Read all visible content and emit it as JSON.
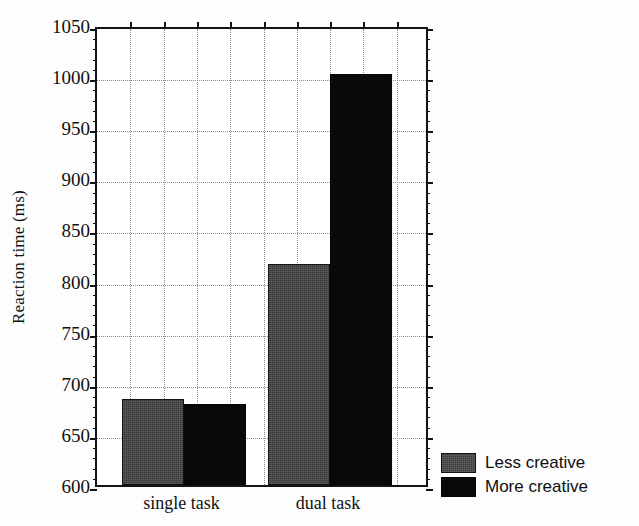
{
  "chart_data": {
    "type": "bar",
    "title": "",
    "xlabel": "",
    "ylabel": "Reaction time (ms)",
    "categories": [
      "single task",
      "dual task"
    ],
    "series": [
      {
        "name": "Less creative",
        "color": "#3a3a3a",
        "values": [
          684,
          816
        ]
      },
      {
        "name": "More creative",
        "color": "#090909",
        "values": [
          679,
          1002
        ]
      }
    ],
    "ylim": [
      600,
      1050
    ],
    "ytick_step": 50,
    "yticks": [
      600,
      650,
      700,
      750,
      800,
      850,
      900,
      950,
      1000,
      1050
    ],
    "ytick_labels": [
      "600",
      "650",
      "700",
      "750",
      "800",
      "850",
      "900",
      "950",
      "1000",
      "1050"
    ],
    "grid": "both-dotted",
    "vertical_gridlines": 9,
    "legend_position": "bottom-right-outside",
    "legend_entries": [
      "Less creative",
      "More creative"
    ]
  },
  "axes": {
    "y_title": "Reaction time (ms)",
    "x_tick_labels": [
      "single task",
      "dual task"
    ]
  },
  "legend": {
    "items": [
      {
        "label": "Less creative",
        "swatch": "less-creative-swatch"
      },
      {
        "label": "More creative",
        "swatch": "more-creative-swatch"
      }
    ]
  }
}
